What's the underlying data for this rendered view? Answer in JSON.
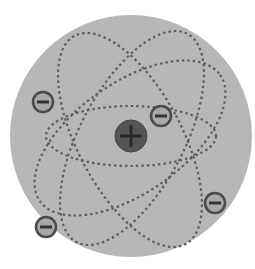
{
  "diagram": {
    "nucleus": {
      "symbol": "+",
      "label": "nucleus (positive charge)"
    },
    "electrons": [
      {
        "symbol": "−",
        "label": "electron"
      },
      {
        "symbol": "−",
        "label": "electron"
      },
      {
        "symbol": "−",
        "label": "electron"
      },
      {
        "symbol": "−",
        "label": "electron"
      }
    ],
    "orbit_count": 4,
    "colors": {
      "background_disc": "#b5b5b5",
      "orbit": "#606060",
      "nucleus_fill": "#555555",
      "nucleus_sign": "#2a2a2a",
      "electron_fill": "#a8a8a8",
      "electron_stroke": "#4a4a4a",
      "electron_sign": "#333333"
    }
  }
}
